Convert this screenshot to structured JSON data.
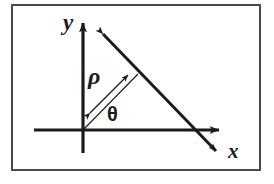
{
  "figure": {
    "kind": "geometry-diagram",
    "background_color": "#ffffff",
    "border_color": "#4a4a4a",
    "stroke_color": "#1b1b1b",
    "frame": {
      "x": 11,
      "y": 4,
      "width": 250,
      "height": 167
    },
    "labels": {
      "y_axis": "y",
      "x_axis": "x",
      "rho": "ρ",
      "theta": "θ"
    },
    "geometry": {
      "origin": {
        "x": 83,
        "y": 130
      },
      "y_axis": {
        "x1": 83,
        "y1": 153,
        "x2": 83,
        "y2": 20,
        "arrow": "up"
      },
      "x_axis": {
        "x1": 34,
        "y1": 130,
        "x2": 226,
        "y2": 130,
        "arrow": "right"
      },
      "line": {
        "x1": 98,
        "y1": 29,
        "x2": 221,
        "y2": 156,
        "arrow": "both"
      },
      "normal_segment": {
        "x1": 86,
        "y1": 117,
        "x2": 132,
        "y2": 71,
        "arrow": "both"
      },
      "angle_ray": {
        "x1": 83,
        "y1": 130,
        "x2": 137,
        "y2": 75
      },
      "theta_degrees": 45
    }
  }
}
